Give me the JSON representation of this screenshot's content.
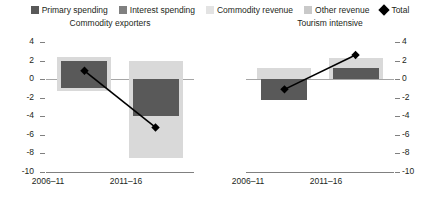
{
  "legend": {
    "items": [
      {
        "label": "Primary spending",
        "color": "#595959",
        "marker": "square",
        "name": "primary-spending"
      },
      {
        "label": "Interest spending",
        "color": "#808080",
        "marker": "square",
        "name": "interest-spending"
      },
      {
        "label": "Commodity revenue",
        "color": "#d9d9d9",
        "marker": "square",
        "name": "commodity-revenue"
      },
      {
        "label": "Other revenue",
        "color": "#bfbfbf",
        "marker": "square",
        "name": "other-revenue"
      },
      {
        "label": "Total",
        "color": "#000000",
        "marker": "diamond",
        "name": "total"
      }
    ]
  },
  "chart_data": {
    "type": "bar",
    "title": "",
    "xlabel": "",
    "ylabel": "",
    "ylim": [
      -10,
      4
    ],
    "yticks": [
      4,
      2,
      0,
      -2,
      -4,
      -6,
      -8,
      -10
    ],
    "ytick_labels": [
      "4",
      "2",
      "0",
      "-2",
      "-4",
      "-6",
      "-8",
      "-10"
    ],
    "grid": false,
    "legend_position": "top",
    "panels": [
      {
        "title": "Commodity exporters",
        "categories": [
          "2006–11",
          "2011–16"
        ],
        "series": [
          {
            "name": "Commodity revenue",
            "color": "#d9d9d9",
            "values": [
              [
                -1.3,
                2.4
              ],
              [
                -8.5,
                2.0
              ]
            ]
          },
          {
            "name": "Primary spending",
            "color": "#595959",
            "values": [
              [
                -1.0,
                2.0
              ],
              [
                -4.0,
                0.0
              ]
            ]
          }
        ],
        "total": {
          "name": "Total",
          "color": "#000000",
          "values": [
            0.9,
            -5.2
          ]
        }
      },
      {
        "title": "Tourism intensive",
        "categories": [
          "2006–11",
          "2011–16"
        ],
        "series": [
          {
            "name": "Commodity revenue",
            "color": "#d9d9d9",
            "values": [
              [
                0.0,
                1.2
              ],
              [
                0.0,
                2.3
              ]
            ]
          },
          {
            "name": "Primary spending",
            "color": "#595959",
            "values": [
              [
                -2.2,
                0.0
              ],
              [
                0.0,
                1.2
              ]
            ]
          }
        ],
        "total": {
          "name": "Total",
          "color": "#000000",
          "values": [
            -1.1,
            2.6
          ]
        }
      }
    ]
  }
}
